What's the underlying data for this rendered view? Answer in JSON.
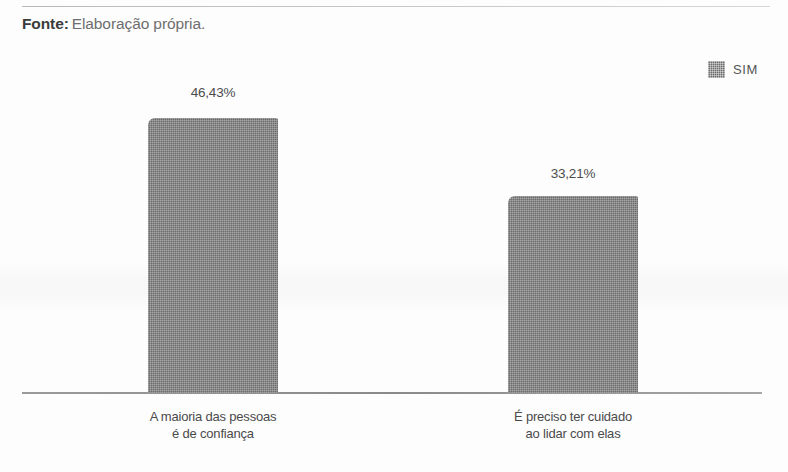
{
  "caption": {
    "label": "Fonte:",
    "value": "Elaboração própria."
  },
  "legend": {
    "position": "top-right",
    "entries": [
      {
        "name": "SIM",
        "swatch_color": "#6b6b6b"
      }
    ]
  },
  "chart_data": {
    "type": "bar",
    "title": "",
    "subtitle": "",
    "xlabel": "",
    "ylabel": "",
    "grid": false,
    "legend_position": "top-right",
    "ylim": [
      0,
      50
    ],
    "categories": [
      "A maioria das pessoas\né de confiança",
      "É preciso ter cuidado\nao lidar com elas"
    ],
    "category_lines": [
      [
        "A maioria das pessoas",
        "é de confiança"
      ],
      [
        "É preciso ter cuidado",
        "ao lidar com elas"
      ]
    ],
    "series": [
      {
        "name": "SIM",
        "color": "#6b6b6b",
        "values": [
          46.43,
          33.21
        ],
        "value_labels": [
          "46,43%",
          "33,21%"
        ]
      }
    ]
  }
}
